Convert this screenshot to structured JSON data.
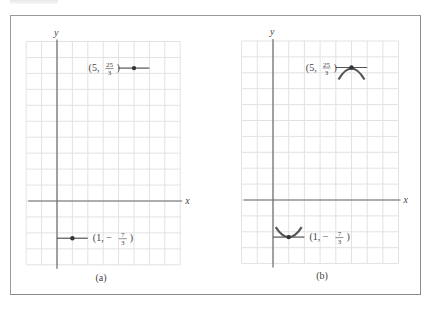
{
  "figure": {
    "panels": [
      {
        "id": "a",
        "caption": "(a)",
        "x_axis_label": "x",
        "y_axis_label": "y",
        "grid": {
          "x_min": -2,
          "x_max": 8,
          "y_min": -4,
          "y_max": 10
        },
        "points": [
          {
            "x": 5,
            "y": 8.333,
            "label_prefix": "(5,",
            "label_num": "25",
            "label_den": "3",
            "label_suffix": ")",
            "label_side": "left",
            "tangent": "horizontal",
            "curve": "none"
          },
          {
            "x": 1,
            "y": -2.333,
            "label_prefix": "(1, −",
            "label_num": "7",
            "label_den": "3",
            "label_suffix": ")",
            "label_side": "right",
            "tangent": "horizontal",
            "curve": "none"
          }
        ]
      },
      {
        "id": "b",
        "caption": "(b)",
        "x_axis_label": "x",
        "y_axis_label": "y",
        "grid": {
          "x_min": -2,
          "x_max": 8,
          "y_min": -4,
          "y_max": 10
        },
        "points": [
          {
            "x": 5,
            "y": 8.333,
            "label_prefix": "(5,",
            "label_num": "25",
            "label_den": "3",
            "label_suffix": ")",
            "label_side": "left",
            "tangent": "horizontal",
            "curve": "concave-down (local maximum)"
          },
          {
            "x": 1,
            "y": -2.333,
            "label_prefix": "(1, −",
            "label_num": "7",
            "label_den": "3",
            "label_suffix": ")",
            "label_side": "right",
            "tangent": "horizontal",
            "curve": "concave-up (local minimum)"
          }
        ]
      }
    ]
  },
  "colors": {
    "grid": "#e2e2e2",
    "axis": "#6b6b6b",
    "curve": "#555555",
    "frame": "#9a9a9a"
  }
}
